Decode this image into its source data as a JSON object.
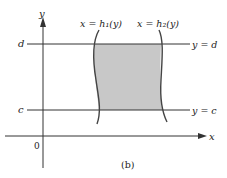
{
  "figure": {
    "caption": "(b)",
    "origin_label": "0",
    "x_axis_label": "x",
    "y_axis_label": "y",
    "lines": {
      "top": {
        "left_label": "d",
        "right_label": "y = d"
      },
      "bottom": {
        "left_label": "c",
        "right_label": "y = c"
      }
    },
    "curves": {
      "left": {
        "label": "x = h₁(y)"
      },
      "right": {
        "label": "x = h₂(y)"
      }
    },
    "colors": {
      "region_fill": "#c8c8c8",
      "stroke": "#333333"
    }
  }
}
